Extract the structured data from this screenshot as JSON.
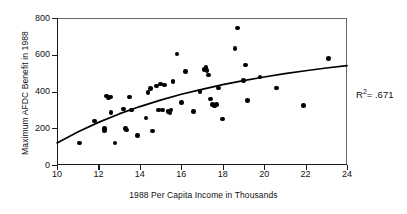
{
  "chart_data": {
    "type": "scatter",
    "title": "",
    "xlabel": "1988 Per Capita Income in Thousands",
    "ylabel": "Maximum AFDC Benefit in 1988",
    "xlim": [
      10,
      24
    ],
    "ylim": [
      0,
      800
    ],
    "xticks": [
      10,
      12,
      14,
      16,
      18,
      20,
      22,
      24
    ],
    "yticks": [
      0,
      200,
      400,
      600,
      800
    ],
    "grid": false,
    "legend": null,
    "annotations": [
      {
        "name": "r-squared",
        "prefix": "R",
        "exponent": "2",
        "text": "= .671",
        "value": 0.671
      }
    ],
    "points": [
      {
        "x": 11.1,
        "y": 120
      },
      {
        "x": 11.8,
        "y": 240
      },
      {
        "x": 12.3,
        "y": 200
      },
      {
        "x": 12.3,
        "y": 188
      },
      {
        "x": 12.4,
        "y": 375
      },
      {
        "x": 12.5,
        "y": 368
      },
      {
        "x": 12.6,
        "y": 370
      },
      {
        "x": 12.6,
        "y": 285
      },
      {
        "x": 12.8,
        "y": 120
      },
      {
        "x": 13.2,
        "y": 305
      },
      {
        "x": 13.3,
        "y": 200
      },
      {
        "x": 13.35,
        "y": 190
      },
      {
        "x": 13.5,
        "y": 370
      },
      {
        "x": 13.6,
        "y": 300
      },
      {
        "x": 13.9,
        "y": 160
      },
      {
        "x": 14.3,
        "y": 255
      },
      {
        "x": 14.4,
        "y": 395
      },
      {
        "x": 14.5,
        "y": 415
      },
      {
        "x": 14.6,
        "y": 185
      },
      {
        "x": 14.8,
        "y": 430
      },
      {
        "x": 14.9,
        "y": 300
      },
      {
        "x": 15.0,
        "y": 440
      },
      {
        "x": 15.1,
        "y": 300
      },
      {
        "x": 15.2,
        "y": 435
      },
      {
        "x": 15.35,
        "y": 290
      },
      {
        "x": 15.45,
        "y": 283
      },
      {
        "x": 15.5,
        "y": 300
      },
      {
        "x": 15.6,
        "y": 455
      },
      {
        "x": 15.8,
        "y": 605
      },
      {
        "x": 16.0,
        "y": 340
      },
      {
        "x": 16.2,
        "y": 510
      },
      {
        "x": 16.6,
        "y": 290
      },
      {
        "x": 16.9,
        "y": 400
      },
      {
        "x": 17.1,
        "y": 520
      },
      {
        "x": 17.2,
        "y": 530
      },
      {
        "x": 17.25,
        "y": 515
      },
      {
        "x": 17.3,
        "y": 490
      },
      {
        "x": 17.4,
        "y": 360
      },
      {
        "x": 17.5,
        "y": 330
      },
      {
        "x": 17.6,
        "y": 322
      },
      {
        "x": 17.7,
        "y": 330
      },
      {
        "x": 17.8,
        "y": 420
      },
      {
        "x": 18.0,
        "y": 250
      },
      {
        "x": 18.6,
        "y": 635
      },
      {
        "x": 18.7,
        "y": 745
      },
      {
        "x": 19.0,
        "y": 460
      },
      {
        "x": 19.1,
        "y": 545
      },
      {
        "x": 19.2,
        "y": 350
      },
      {
        "x": 19.8,
        "y": 480
      },
      {
        "x": 20.6,
        "y": 420
      },
      {
        "x": 21.9,
        "y": 325
      },
      {
        "x": 23.1,
        "y": 580
      }
    ],
    "fit_curve": {
      "description": "logarithmic trend line",
      "points": [
        {
          "x": 10.0,
          "y": 120
        },
        {
          "x": 11.0,
          "y": 180
        },
        {
          "x": 12.0,
          "y": 232
        },
        {
          "x": 13.0,
          "y": 278
        },
        {
          "x": 14.0,
          "y": 318
        },
        {
          "x": 15.0,
          "y": 353
        },
        {
          "x": 16.0,
          "y": 385
        },
        {
          "x": 17.0,
          "y": 412
        },
        {
          "x": 18.0,
          "y": 437
        },
        {
          "x": 19.0,
          "y": 459
        },
        {
          "x": 20.0,
          "y": 479
        },
        {
          "x": 21.0,
          "y": 497
        },
        {
          "x": 22.0,
          "y": 513
        },
        {
          "x": 23.0,
          "y": 528
        },
        {
          "x": 24.0,
          "y": 541
        }
      ]
    }
  }
}
